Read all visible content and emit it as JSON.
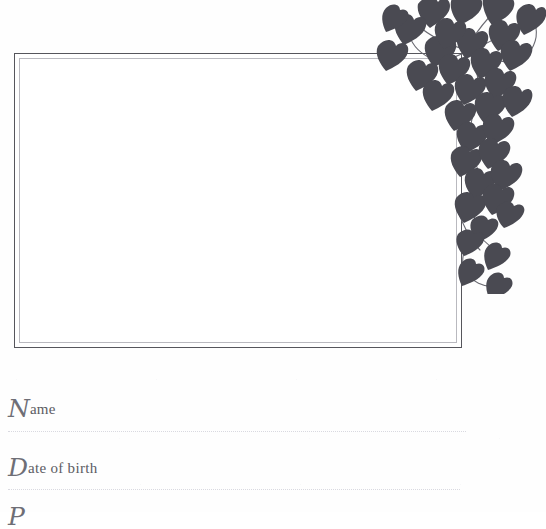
{
  "page": {
    "background_color": "#fefefe",
    "kind": "baby-book-page"
  },
  "photo_frame": {
    "name": "photo-placeholder-frame",
    "outer_border_color": "#56565c",
    "inner_border_color": "#b9b9bf",
    "fill_color": "#ffffff",
    "caption": ""
  },
  "decoration": {
    "icon_name": "ivy-vine-decoration",
    "leaf_color": "#4a4a52",
    "stem_color": "#6a6a72",
    "position": "top-right-corner"
  },
  "form": {
    "fields": [
      {
        "id": "name",
        "swash": "N",
        "rest": "ame",
        "value": "",
        "placeholder": "",
        "rule_color": "#d9d9e0"
      },
      {
        "id": "date-of-birth",
        "swash": "D",
        "rest": "ate of birth",
        "value": "",
        "placeholder": "",
        "rule_color": "#d9d9e0"
      },
      {
        "id": "place-of-birth",
        "swash": "P",
        "rest": "",
        "value": "",
        "placeholder": "",
        "rule_color": "#d9d9e0"
      }
    ]
  }
}
